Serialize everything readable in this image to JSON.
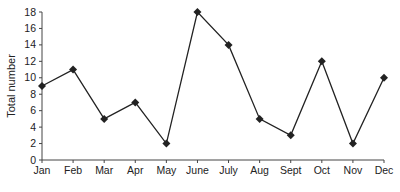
{
  "chart_data": {
    "type": "line",
    "title": "",
    "xlabel": "",
    "ylabel": "Total number",
    "categories": [
      "Jan",
      "Feb",
      "Mar",
      "Apr",
      "May",
      "June",
      "July",
      "Aug",
      "Sept",
      "Oct",
      "Nov",
      "Dec"
    ],
    "series": [
      {
        "name": "Total number",
        "values": [
          9,
          11,
          5,
          7,
          2,
          18,
          14,
          5,
          3,
          12,
          2,
          10
        ],
        "color": "#222222",
        "marker": "diamond"
      }
    ],
    "ylim": [
      0,
      18
    ],
    "yticks": [
      0,
      2,
      4,
      6,
      8,
      10,
      12,
      14,
      16,
      18
    ],
    "grid": false,
    "legend": "none"
  }
}
